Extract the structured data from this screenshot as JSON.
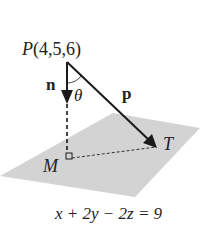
{
  "diagram": {
    "point_label": "P",
    "point_coords": "(4,5,6)",
    "normal_label": "n",
    "angle_label": "θ",
    "vector_label": "p",
    "foot_label": "M",
    "target_label": "T",
    "plane_equation": "x + 2y − 2z = 9",
    "colors": {
      "plane": "#d3d3d3",
      "lines": "#1a1a1a",
      "text": "#222222"
    }
  }
}
